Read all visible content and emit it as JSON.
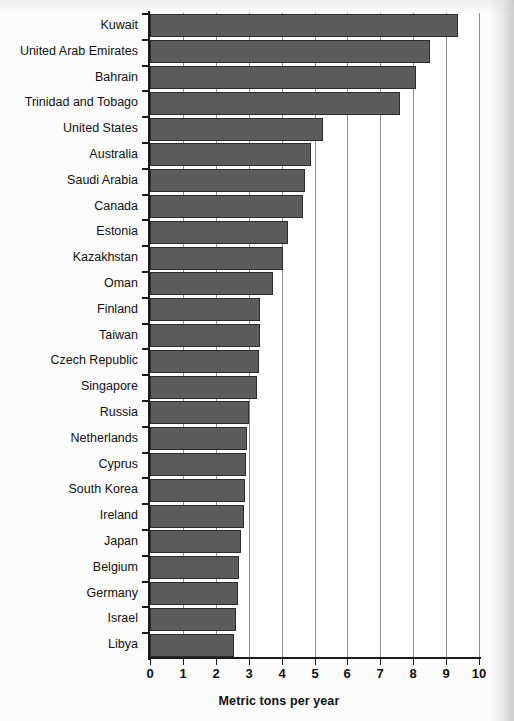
{
  "chart_data": {
    "type": "bar",
    "orientation": "horizontal",
    "title": "",
    "xlabel": "Metric tons per year",
    "ylabel": "",
    "xlim": [
      0,
      10
    ],
    "xticks": [
      "0",
      "1",
      "2",
      "3",
      "4",
      "5",
      "6",
      "7",
      "8",
      "9",
      "10"
    ],
    "grid": "vertical",
    "legend": "none",
    "bar_color": "#5c5c5c",
    "bar_edge_color": "#2b2b2b",
    "categories": [
      "Kuwait",
      "United Arab Emirates",
      "Bahrain",
      "Trinidad and Tobago",
      "United States",
      "Australia",
      "Saudi Arabia",
      "Canada",
      "Estonia",
      "Kazakhstan",
      "Oman",
      "Finland",
      "Taiwan",
      "Czech Republic",
      "Singapore",
      "Russia",
      "Netherlands",
      "Cyprus",
      "South Korea",
      "Ireland",
      "Japan",
      "Belgium",
      "Germany",
      "Israel",
      "Libya"
    ],
    "values": [
      9.35,
      8.5,
      8.1,
      7.6,
      5.25,
      4.9,
      4.7,
      4.65,
      4.2,
      4.05,
      3.75,
      3.35,
      3.35,
      3.3,
      3.25,
      3.0,
      2.95,
      2.92,
      2.88,
      2.85,
      2.78,
      2.72,
      2.66,
      2.6,
      2.55
    ]
  }
}
